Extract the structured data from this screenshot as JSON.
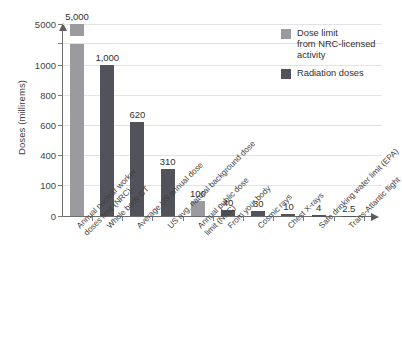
{
  "chart_data": {
    "type": "bar",
    "title": "",
    "xlabel": "",
    "ylabel": "Doses (millirems)",
    "categories": [
      "Annual nuclear worker\ndoses limit (NRC)",
      "Whole body CT",
      "Average US annual dose",
      "US avg. natural background dose",
      "Annual public dose\nlimit (NRC)",
      "From your body",
      "Cosmic rays",
      "Chest X-rays",
      "Safe drinking water limit (EPA)",
      "Trans-Atlantic flight"
    ],
    "values": [
      5000,
      1000,
      620,
      310,
      100,
      40,
      30,
      10,
      4,
      2.5
    ],
    "value_labels": [
      "5,000",
      "1,000",
      "620",
      "310",
      "100",
      "40",
      "30",
      "10",
      "4",
      "2.5"
    ],
    "series": [
      {
        "name": "Dose limit from NRC-licensed activity",
        "color": "#9b9b9f",
        "members": [
          0,
          4
        ]
      },
      {
        "name": "Radiation doses",
        "color": "#52525a",
        "members": [
          1,
          2,
          3,
          5,
          6,
          7,
          8,
          9
        ]
      }
    ],
    "ytick_labels": [
      "0",
      "100",
      "400",
      "600",
      "800",
      "1000",
      "5000"
    ],
    "ytick_values": [
      0,
      100,
      400,
      600,
      800,
      1000,
      5000
    ],
    "ylim": [
      0,
      5000
    ],
    "axis_break": true,
    "axis_break_note": "Y axis is broken between 1000 and 5000",
    "grid": true,
    "legend_position": "top-right"
  },
  "legend": {
    "entries": [
      {
        "label": "Dose limit\nfrom NRC-licensed\nactivity",
        "color": "#9b9b9f",
        "swatch_name": "light-gray"
      },
      {
        "label": "Radiation doses",
        "color": "#52525a",
        "swatch_name": "dark-gray"
      }
    ]
  },
  "axes": {
    "y_title": "Doses (millirems)"
  }
}
